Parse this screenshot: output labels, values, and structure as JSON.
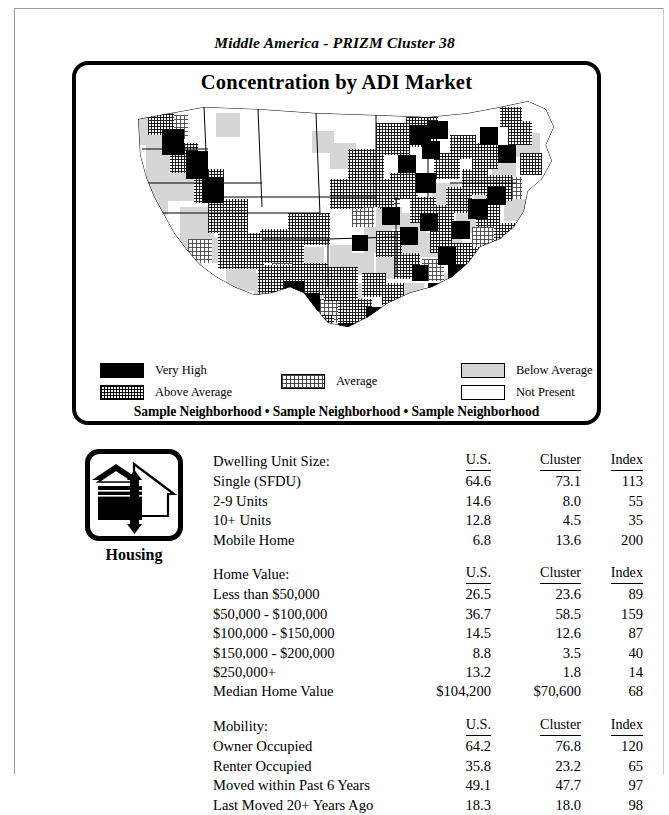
{
  "document": {
    "running_head": "Middle America - PRIZM Cluster 38"
  },
  "map_panel": {
    "title": "Concentration by ADI Market",
    "sample_neighborhoods": "Sample Neighborhood • Sample Neighborhood • Sample Neighborhood",
    "legend": [
      {
        "label": "Very High",
        "swatch": "solid-black",
        "color": "#000000"
      },
      {
        "label": "Above Average",
        "swatch": "dense-hatch",
        "color": "#000000"
      },
      {
        "label": "Average",
        "swatch": "checker",
        "color": "#444444"
      },
      {
        "label": "Below Average",
        "swatch": "light-gray",
        "color": "#d4d4d4"
      },
      {
        "label": "Not Present",
        "swatch": "white-outline",
        "color": "#ffffff"
      }
    ]
  },
  "section": {
    "icon_name": "housing-icon",
    "caption": "Housing"
  },
  "tables": [
    {
      "title": "Dwelling Unit Size:",
      "headers": [
        "U.S.",
        "Cluster",
        "Index"
      ],
      "rows": [
        {
          "label": "Single (SFDU)",
          "us": "64.6",
          "cluster": "73.1",
          "index": "113"
        },
        {
          "label": "2-9 Units",
          "us": "14.6",
          "cluster": "8.0",
          "index": "55"
        },
        {
          "label": "10+ Units",
          "us": "12.8",
          "cluster": "4.5",
          "index": "35"
        },
        {
          "label": "Mobile Home",
          "us": "6.8",
          "cluster": "13.6",
          "index": "200"
        }
      ]
    },
    {
      "title": "Home Value:",
      "headers": [
        "U.S.",
        "Cluster",
        "Index"
      ],
      "rows": [
        {
          "label": "Less than $50,000",
          "us": "26.5",
          "cluster": "23.6",
          "index": "89"
        },
        {
          "label": "$50,000 - $100,000",
          "us": "36.7",
          "cluster": "58.5",
          "index": "159"
        },
        {
          "label": "$100,000 - $150,000",
          "us": "14.5",
          "cluster": "12.6",
          "index": "87"
        },
        {
          "label": "$150,000 - $200,000",
          "us": "8.8",
          "cluster": "3.5",
          "index": "40"
        },
        {
          "label": "$250,000+",
          "us": "13.2",
          "cluster": "1.8",
          "index": "14"
        },
        {
          "label": "Median Home Value",
          "us": "$104,200",
          "cluster": "$70,600",
          "index": "68"
        }
      ]
    },
    {
      "title": "Mobility:",
      "headers": [
        "U.S.",
        "Cluster",
        "Index"
      ],
      "rows": [
        {
          "label": "Owner Occupied",
          "us": "64.2",
          "cluster": "76.8",
          "index": "120"
        },
        {
          "label": "Renter Occupied",
          "us": "35.8",
          "cluster": "23.2",
          "index": "65"
        },
        {
          "label": "Moved within Past 6 Years",
          "us": "49.1",
          "cluster": "47.7",
          "index": "97"
        },
        {
          "label": "Last Moved 20+ Years Ago",
          "us": "18.3",
          "cluster": "18.0",
          "index": "98"
        }
      ]
    }
  ]
}
